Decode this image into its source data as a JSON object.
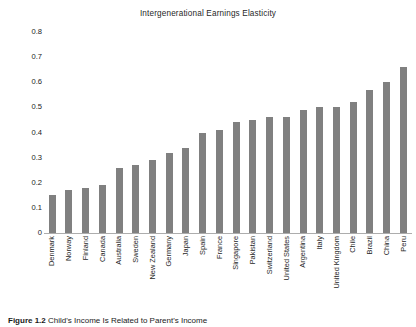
{
  "chart_data": {
    "type": "bar",
    "title": "Intergenerational Earnings Elasticity",
    "xlabel": "",
    "ylabel": "",
    "ylim": [
      0,
      0.8
    ],
    "grid": false,
    "legend": null,
    "yticks": [
      "0.8",
      "0.7",
      "0.6",
      "0.5",
      "0.4",
      "0.3",
      "0.2",
      "0.1",
      "0"
    ],
    "ytick_values": [
      0.8,
      0.7,
      0.6,
      0.5,
      0.4,
      0.3,
      0.2,
      0.1,
      0
    ],
    "categories": [
      "Denmark",
      "Norway",
      "Finland",
      "Canada",
      "Australia",
      "Sweden",
      "New Zealand",
      "Germany",
      "Japan",
      "Spain",
      "France",
      "Singapore",
      "Pakistan",
      "Switzerland",
      "United States",
      "Argentina",
      "Italy",
      "United Kingdom",
      "Chile",
      "Brazil",
      "China",
      "Peru"
    ],
    "values": [
      0.15,
      0.17,
      0.18,
      0.19,
      0.26,
      0.27,
      0.29,
      0.32,
      0.34,
      0.4,
      0.41,
      0.44,
      0.45,
      0.46,
      0.46,
      0.49,
      0.5,
      0.5,
      0.52,
      0.57,
      0.6,
      0.66
    ],
    "bar_color": "#808080",
    "background_color": "#ffffff",
    "axis_color": "#adadad"
  },
  "caption": {
    "label": "Figure 1.2",
    "text": "Child's Income Is Related to Parent's Income"
  }
}
